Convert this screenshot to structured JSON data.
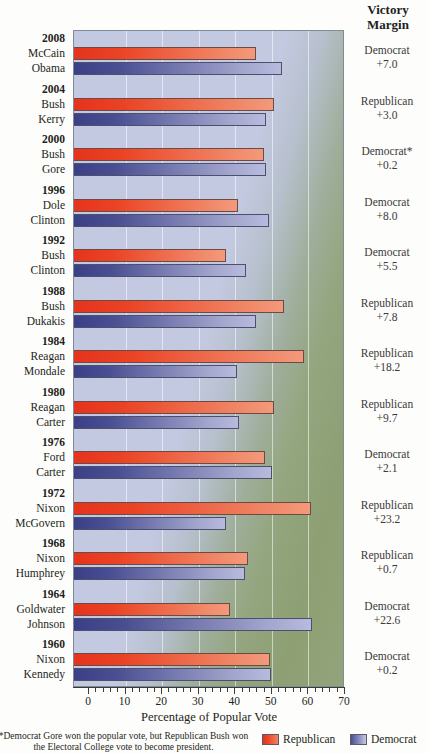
{
  "right_header": {
    "line1": "Victory",
    "line2": "Margin"
  },
  "axis": {
    "title": "Percentage of Popular Vote",
    "ticks": [
      0,
      10,
      20,
      30,
      40,
      50,
      60,
      70
    ],
    "xmin": 0,
    "xmax": 70
  },
  "legend": [
    {
      "label": "Republican",
      "color": "#e5331d"
    },
    {
      "label": "Democrat",
      "color": "#4a4f93"
    }
  ],
  "footnote": "*Democrat Gore won the popular vote, but Republican Bush won the Electoral College vote to become president.",
  "chart_data": {
    "type": "bar",
    "title": "",
    "xlabel": "Percentage of Popular Vote",
    "ylabel": "",
    "xlim": [
      0,
      70
    ],
    "grid": true,
    "orientation": "horizontal",
    "legend_position": "bottom-right",
    "series": [
      {
        "name": "Republican",
        "color": "#e5331d"
      },
      {
        "name": "Democrat",
        "color": "#4a4f93"
      }
    ],
    "elections": [
      {
        "year": "2008",
        "republican": {
          "name": "McCain",
          "value": 45.7
        },
        "democrat": {
          "name": "Obama",
          "value": 52.9
        },
        "margin_party": "Democrat",
        "margin_value": "+7.0"
      },
      {
        "year": "2004",
        "republican": {
          "name": "Bush",
          "value": 50.7
        },
        "democrat": {
          "name": "Kerry",
          "value": 48.3
        },
        "margin_party": "Republican",
        "margin_value": "+3.0"
      },
      {
        "year": "2000",
        "republican": {
          "name": "Bush",
          "value": 47.9
        },
        "democrat": {
          "name": "Gore",
          "value": 48.4
        },
        "margin_party": "Democrat*",
        "margin_value": "+0.2"
      },
      {
        "year": "1996",
        "republican": {
          "name": "Dole",
          "value": 40.7
        },
        "democrat": {
          "name": "Clinton",
          "value": 49.2
        },
        "margin_party": "Democrat",
        "margin_value": "+8.0"
      },
      {
        "year": "1992",
        "republican": {
          "name": "Bush",
          "value": 37.4
        },
        "democrat": {
          "name": "Clinton",
          "value": 43.0
        },
        "margin_party": "Democrat",
        "margin_value": "+5.5"
      },
      {
        "year": "1988",
        "republican": {
          "name": "Bush",
          "value": 53.4
        },
        "democrat": {
          "name": "Dukakis",
          "value": 45.6
        },
        "margin_party": "Republican",
        "margin_value": "+7.8"
      },
      {
        "year": "1984",
        "republican": {
          "name": "Reagan",
          "value": 58.8
        },
        "democrat": {
          "name": "Mondale",
          "value": 40.6
        },
        "margin_party": "Republican",
        "margin_value": "+18.2"
      },
      {
        "year": "1980",
        "republican": {
          "name": "Reagan",
          "value": 50.7
        },
        "democrat": {
          "name": "Carter",
          "value": 41.0
        },
        "margin_party": "Republican",
        "margin_value": "+9.7"
      },
      {
        "year": "1976",
        "republican": {
          "name": "Ford",
          "value": 48.0
        },
        "democrat": {
          "name": "Carter",
          "value": 50.1
        },
        "margin_party": "Democrat",
        "margin_value": "+2.1"
      },
      {
        "year": "1972",
        "republican": {
          "name": "Nixon",
          "value": 60.7
        },
        "democrat": {
          "name": "McGovern",
          "value": 37.5
        },
        "margin_party": "Republican",
        "margin_value": "+23.2"
      },
      {
        "year": "1968",
        "republican": {
          "name": "Nixon",
          "value": 43.4
        },
        "democrat": {
          "name": "Humphrey",
          "value": 42.7
        },
        "margin_party": "Republican",
        "margin_value": "+0.7"
      },
      {
        "year": "1964",
        "republican": {
          "name": "Goldwater",
          "value": 38.5
        },
        "democrat": {
          "name": "Johnson",
          "value": 61.1
        },
        "margin_party": "Democrat",
        "margin_value": "+22.6"
      },
      {
        "year": "1960",
        "republican": {
          "name": "Nixon",
          "value": 49.6
        },
        "democrat": {
          "name": "Kennedy",
          "value": 49.7
        },
        "margin_party": "Democrat",
        "margin_value": "+0.2"
      }
    ]
  }
}
